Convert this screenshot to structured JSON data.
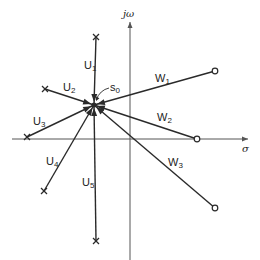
{
  "diagram": {
    "type": "root-locus-branches",
    "axes": {
      "imag_label": "jω",
      "real_label": "σ",
      "origin": [
        130,
        139
      ],
      "imag_axis": {
        "x": 130,
        "y_top": 22,
        "y_bottom": 260
      },
      "real_axis": {
        "y": 139,
        "x_left": 12,
        "x_right": 248
      }
    },
    "convergence_point": {
      "label_main": "s",
      "label_sub": "0",
      "x": 94,
      "y": 105,
      "label_x": 110,
      "label_y": 82
    },
    "u_branches": [
      {
        "label_main": "U",
        "label_sub": "1",
        "end": [
          96,
          37
        ],
        "marker": "x",
        "label_pos": [
          84,
          60
        ]
      },
      {
        "label_main": "U",
        "label_sub": "2",
        "end": [
          45,
          89
        ],
        "marker": "x",
        "label_pos": [
          63,
          82
        ]
      },
      {
        "label_main": "U",
        "label_sub": "3",
        "end": [
          27,
          137
        ],
        "marker": "x",
        "label_pos": [
          33,
          116
        ]
      },
      {
        "label_main": "U",
        "label_sub": "4",
        "end": [
          44,
          191
        ],
        "marker": "x",
        "label_pos": [
          46,
          156
        ]
      },
      {
        "label_main": "U",
        "label_sub": "5",
        "end": [
          96,
          241
        ],
        "marker": "x",
        "label_pos": [
          82,
          177
        ]
      }
    ],
    "w_branches": [
      {
        "label_main": "W",
        "label_sub": "1",
        "end": [
          215,
          71
        ],
        "marker": "o",
        "label_pos": [
          155,
          73
        ]
      },
      {
        "label_main": "W",
        "label_sub": "2",
        "end": [
          197,
          139
        ],
        "marker": "o",
        "label_pos": [
          157,
          112
        ]
      },
      {
        "label_main": "W",
        "label_sub": "3",
        "end": [
          215,
          208
        ],
        "marker": "o",
        "label_pos": [
          168,
          157
        ]
      }
    ],
    "colors": {
      "line": "#2a2a2a",
      "axis": "#555555",
      "background": "#ffffff"
    }
  }
}
